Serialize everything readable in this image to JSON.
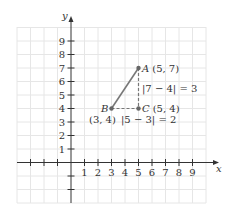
{
  "diagram": {
    "type": "coordinate-plane",
    "axes": {
      "x_label": "x",
      "y_label": "y",
      "x_ticks": [
        "1",
        "2",
        "3",
        "4",
        "5",
        "6",
        "7",
        "8",
        "9"
      ],
      "y_ticks": [
        "1",
        "2",
        "3",
        "4",
        "5",
        "6",
        "7",
        "8",
        "9"
      ]
    },
    "points": {
      "A": {
        "name": "A",
        "coords": "(5, 7)"
      },
      "B": {
        "name": "B",
        "coords": "(3, 4)"
      },
      "C": {
        "name": "C",
        "coords": "(5, 4)"
      }
    },
    "annotations": {
      "vertical_distance": "|7 − 4| = 3",
      "horizontal_distance": "|5 − 3| = 2"
    },
    "colors": {
      "grid": "#e6e6e6",
      "axis": "#333333",
      "segment": "#777777",
      "point": "#666666"
    }
  }
}
